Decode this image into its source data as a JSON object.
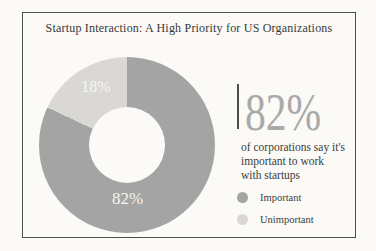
{
  "title": "Startup Interaction: A High Priority for US Organizations",
  "colors": {
    "important": "#a4a4a4",
    "unimportant": "#d9d8d4",
    "background": "#fbfaf7",
    "border": "#4d4d4d",
    "stat_text": "#a9a9a9",
    "accent_line": "#4f4f4f",
    "body_text": "#3c3c3c",
    "slice_label_text": "#f6f5f1"
  },
  "chart_data": {
    "type": "pie",
    "donut": true,
    "title": "Startup Interaction: A High Priority for US Organizations",
    "categories": [
      "Important",
      "Unimportant"
    ],
    "values": [
      82,
      18
    ],
    "unit": "%",
    "slice_labels": [
      "82%",
      "18%"
    ],
    "start_angle_deg": 0,
    "direction": "clockwise",
    "legend_position": "right"
  },
  "stat": {
    "value": "82%",
    "description_lines": [
      "of corporations say it's",
      "important to work",
      "with startups"
    ]
  },
  "legend": {
    "items": [
      {
        "label": "Important",
        "color": "#a4a4a4"
      },
      {
        "label": "Unimportant",
        "color": "#d9d8d4"
      }
    ]
  }
}
